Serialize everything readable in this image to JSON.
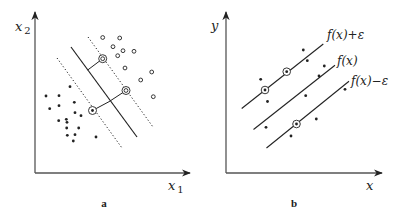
{
  "panel_a": {
    "caption": "a",
    "x_axis_label": "x",
    "x_axis_sub": "1",
    "y_axis_label": "x",
    "y_axis_sub": "2",
    "axis": {
      "origin": [
        35,
        173
      ],
      "x_end": 190,
      "y_end": 12
    },
    "hyperplane": [
      [
        71,
        47
      ],
      [
        137,
        137
      ]
    ],
    "margin_upper": [
      [
        88,
        37
      ],
      [
        153,
        127
      ]
    ],
    "margin_lower": [
      [
        57,
        58
      ],
      [
        122,
        148
      ]
    ],
    "connectors": [
      [
        [
          102.7,
          58.7
        ],
        [
          87.7,
          70
        ]
      ],
      [
        [
          126,
          90.5
        ],
        [
          109,
          101.7
        ]
      ],
      [
        [
          92.5,
          110.5
        ],
        [
          109,
          101.7
        ]
      ]
    ],
    "class_open": [
      [
        102.7,
        37.5
      ],
      [
        119.7,
        38
      ],
      [
        113,
        46.7
      ],
      [
        123,
        50.7
      ],
      [
        134,
        51.3
      ],
      [
        117.7,
        55.7
      ],
      [
        125,
        68
      ],
      [
        151.7,
        72
      ],
      [
        140.7,
        80
      ],
      [
        153.3,
        96.7
      ]
    ],
    "class_filled": [
      [
        70,
        86.7
      ],
      [
        46,
        96
      ],
      [
        59,
        95.7
      ],
      [
        74.3,
        102.3
      ],
      [
        49.7,
        108.7
      ],
      [
        59,
        105.7
      ],
      [
        75,
        112.7
      ],
      [
        81,
        115.7
      ],
      [
        58.7,
        120.7
      ],
      [
        66.3,
        119.3
      ],
      [
        67,
        122.3
      ],
      [
        66.7,
        128
      ],
      [
        78.7,
        128
      ],
      [
        67.3,
        135.3
      ],
      [
        75,
        134.7
      ],
      [
        73.3,
        141
      ],
      [
        96,
        137
      ]
    ],
    "support_vectors_open": [
      [
        102.7,
        58.7
      ],
      [
        126,
        90.5
      ]
    ],
    "support_vectors_filled": [
      [
        92.5,
        110.5
      ]
    ]
  },
  "panel_b": {
    "caption": "b",
    "x_axis_label": "x",
    "y_axis_label": "y",
    "axis": {
      "origin": [
        226,
        173
      ],
      "x_end": 382,
      "y_end": 12
    },
    "lines": [
      {
        "label": "f(x)+ε",
        "from": [
          241.7,
          108.5
        ],
        "to": [
          323.3,
          44
        ],
        "label_pos": [
          327,
          39
        ]
      },
      {
        "label": "f(x)",
        "from": [
          253.5,
          129.5
        ],
        "to": [
          335,
          65.3
        ],
        "label_pos": [
          337,
          65
        ]
      },
      {
        "label": "f(x)−ε",
        "from": [
          266.5,
          148
        ],
        "to": [
          349,
          81.3
        ],
        "label_pos": [
          351,
          85
        ]
      }
    ],
    "points": [
      [
        303.3,
        50
      ],
      [
        307.3,
        60.7
      ],
      [
        260.7,
        79.3
      ],
      [
        267.5,
        101.5
      ],
      [
        324.3,
        66
      ],
      [
        319,
        76
      ],
      [
        305.7,
        95.7
      ],
      [
        266,
        127.3
      ],
      [
        316.3,
        119
      ],
      [
        291,
        136
      ],
      [
        345,
        89.3
      ]
    ],
    "support_vectors": [
      [
        265,
        90
      ],
      [
        286.7,
        71.7
      ],
      [
        296.5,
        124
      ]
    ]
  },
  "colors": {
    "axis": "#555555",
    "ink": "#222222",
    "background": "#ffffff"
  }
}
